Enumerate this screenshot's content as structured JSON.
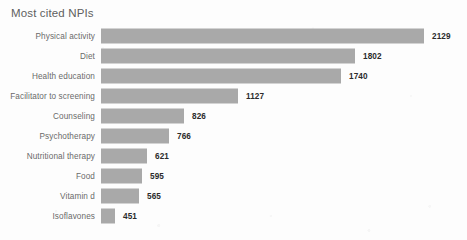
{
  "chart_data": {
    "type": "bar",
    "orientation": "horizontal",
    "title": "Most cited NPIs",
    "xlabel": "",
    "ylabel": "",
    "grid": false,
    "legend": false,
    "value_labels": true,
    "bar_color": "#a9a9a9",
    "title_color": "#5f5f5f",
    "label_color": "#6a6a6a",
    "value_color": "#2b2b2b",
    "xlim": [
      0,
      2129
    ],
    "categories": [
      "Physical activity",
      "Diet",
      "Health education",
      "Facilitator to screening",
      "Counseling",
      "Psychotherapy",
      "Nutritional therapy",
      "Food",
      "Vitamin d",
      "Isoflavones"
    ],
    "values": [
      2129,
      1802,
      1740,
      1127,
      826,
      766,
      621,
      595,
      565,
      451
    ],
    "bar_pixel_widths": [
      323,
      254,
      240,
      137,
      83,
      68,
      46,
      41,
      38,
      14
    ]
  }
}
